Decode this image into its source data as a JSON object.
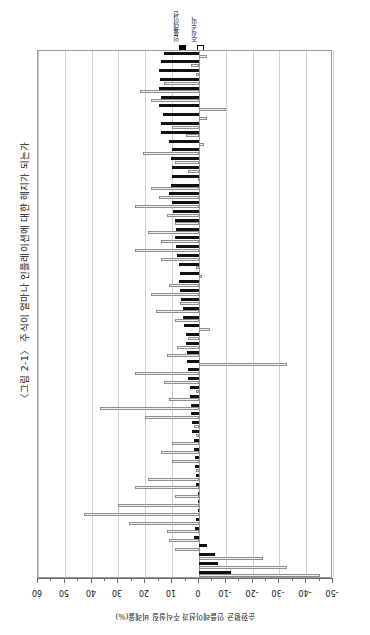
{
  "figure": {
    "title": "〈그림 2-1〉 주식이 얼마나 인플레이션에 대한 헤지가 되는가",
    "rotation_degrees": 90
  },
  "legend": {
    "position": "top-center",
    "entries": [
      {
        "label": "인플레이션",
        "marker": "filled-square",
        "color": "#111111"
      },
      {
        "label": "주식수익",
        "marker": "open-square",
        "color": "#ffffff"
      }
    ]
  },
  "axis": {
    "title": "순환평균 인플레이션과 주식실질 비례율(%)",
    "tick_labels": [
      "60",
      "50",
      "40",
      "30",
      "20",
      "10",
      "0",
      "-10",
      "-20",
      "-30",
      "-40",
      "-50"
    ],
    "min": -50,
    "max": 60,
    "step": 10
  },
  "chart_data": {
    "type": "bar",
    "orientation": "horizontal-paired",
    "title": "〈그림 2-1〉 주식이 얼마나 인플레이션에 대한 헤지가 되는가",
    "xlabel": "순환평균 인플레이션과 주식실질 비례율(%)",
    "ylabel": "",
    "xlim": [
      -50,
      60
    ],
    "grid": true,
    "legend_position": "top",
    "categories": [
      "1",
      "2",
      "3",
      "4",
      "5",
      "6",
      "7",
      "8",
      "9",
      "10",
      "11",
      "12",
      "13",
      "14",
      "15",
      "16",
      "17",
      "18",
      "19",
      "20",
      "21",
      "22",
      "23",
      "24",
      "25",
      "26",
      "27",
      "28",
      "29",
      "30",
      "31",
      "32",
      "33",
      "34",
      "35",
      "36",
      "37",
      "38",
      "39",
      "40",
      "41",
      "42",
      "43",
      "44",
      "45",
      "46",
      "47",
      "48",
      "49",
      "50",
      "51",
      "52",
      "53",
      "54",
      "55",
      "56",
      "57",
      "58",
      "59",
      "60"
    ],
    "series": [
      {
        "name": "인플레이션",
        "marker": "filled-square",
        "color": "#111111",
        "values": [
          13.0,
          14.0,
          15.0,
          14.5,
          15.0,
          14.0,
          15.0,
          13.5,
          14.0,
          14.0,
          11.0,
          10.0,
          10.5,
          10.0,
          10.0,
          10.5,
          11.0,
          10.0,
          9.5,
          9.0,
          8.5,
          9.0,
          8.5,
          8.0,
          7.5,
          7.0,
          7.5,
          7.0,
          6.5,
          6.0,
          6.0,
          5.5,
          5.0,
          5.0,
          4.5,
          4.5,
          4.0,
          4.0,
          3.5,
          3.5,
          3.0,
          3.0,
          2.5,
          2.5,
          2.0,
          2.0,
          1.5,
          1.5,
          1.0,
          1.0,
          0.5,
          0.5,
          0.5,
          1.0,
          1.5,
          2.0,
          -3.0,
          -6.0,
          -7.0,
          -12.0
        ]
      },
      {
        "name": "주식수익",
        "marker": "open-square",
        "color": "#ffffff",
        "values": [
          -3.0,
          3.0,
          1.0,
          13.0,
          22.0,
          18.0,
          -10.0,
          -3.0,
          10.0,
          5.0,
          -2.0,
          21.0,
          9.0,
          4.0,
          0.5,
          18.0,
          15.0,
          24.0,
          12.0,
          9.0,
          19.0,
          14.0,
          24.0,
          14.0,
          1.0,
          -1.0,
          11.0,
          18.0,
          7.0,
          16.0,
          9.0,
          -4.0,
          4.0,
          8.0,
          12.0,
          -33.0,
          24.0,
          13.0,
          1.0,
          11.0,
          37.0,
          20.0,
          2.0,
          1.0,
          10.0,
          14.0,
          10.0,
          1.0,
          19.0,
          24.0,
          9.0,
          30.0,
          43.0,
          26.0,
          12.0,
          11.0,
          9.0,
          -24.0,
          -33.0,
          -45.0
        ]
      }
    ]
  }
}
